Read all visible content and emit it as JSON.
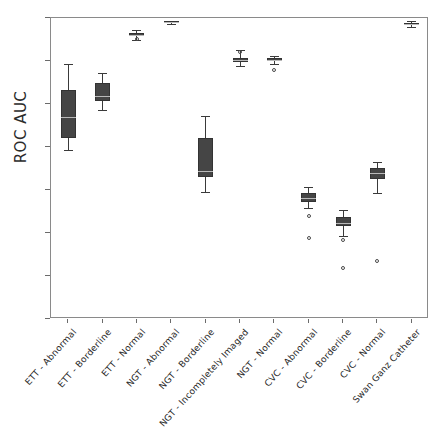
{
  "chart_data": {
    "type": "box",
    "title": "",
    "xlabel": "",
    "ylabel": "ROC AUC",
    "ylim": [
      65,
      100
    ],
    "yticks": [
      65,
      70,
      75,
      80,
      85,
      90,
      95,
      100
    ],
    "grid": false,
    "legend": "none",
    "accent_color": "#454545",
    "median_color": "#b9b9b9",
    "categories": [
      "ETT - Abnormal",
      "ETT - Borderline",
      "ETT - Normal",
      "NGT - Abnormal",
      "NGT - Borderline",
      "NGT - Incompletely Imaged",
      "NGT - Normal",
      "CVC - Abnormal",
      "CVC - Borderline",
      "CVC - Normal",
      "Swan Ganz Catheter"
    ],
    "boxes": [
      {
        "category": "ETT - Abnormal",
        "whisker_low": 84.7,
        "q1": 86.1,
        "median": 88.5,
        "q3": 91.6,
        "whisker_high": 94.7,
        "outliers": []
      },
      {
        "category": "ETT - Borderline",
        "whisker_low": 89.3,
        "q1": 90.3,
        "median": 90.9,
        "q3": 92.4,
        "whisker_high": 93.6,
        "outliers": []
      },
      {
        "category": "ETT - Normal",
        "whisker_low": 97.4,
        "q1": 97.9,
        "median": 98.0,
        "q3": 98.2,
        "whisker_high": 98.6,
        "outliers": [
          97.6
        ]
      },
      {
        "category": "NGT - Abnormal",
        "whisker_low": 99.3,
        "q1": 99.4,
        "median": 99.5,
        "q3": 99.6,
        "whisker_high": 99.7,
        "outliers": []
      },
      {
        "category": "NGT - Borderline",
        "whisker_low": 79.8,
        "q1": 81.5,
        "median": 82.2,
        "q3": 86.0,
        "whisker_high": 88.6,
        "outliers": []
      },
      {
        "category": "NGT - Incompletely Imaged",
        "whisker_low": 94.4,
        "q1": 94.9,
        "median": 95.1,
        "q3": 95.4,
        "whisker_high": 96.3,
        "outliers": [
          96.0
        ]
      },
      {
        "category": "NGT - Normal",
        "whisker_low": 94.7,
        "q1": 95.0,
        "median": 95.1,
        "q3": 95.3,
        "whisker_high": 95.6,
        "outliers": [
          93.9
        ]
      },
      {
        "category": "CVC - Abnormal",
        "whisker_low": 77.9,
        "q1": 78.6,
        "median": 79.1,
        "q3": 79.6,
        "whisker_high": 80.3,
        "outliers": [
          77.0,
          74.4
        ]
      },
      {
        "category": "CVC - Borderline",
        "whisker_low": 74.7,
        "q1": 75.8,
        "median": 76.2,
        "q3": 76.9,
        "whisker_high": 77.7,
        "outliers": [
          74.2,
          70.9
        ]
      },
      {
        "category": "CVC - Normal",
        "whisker_low": 79.6,
        "q1": 81.3,
        "median": 82.0,
        "q3": 82.6,
        "whisker_high": 83.3,
        "outliers": [
          71.7
        ]
      },
      {
        "category": "Swan Ganz Catheter",
        "whisker_low": 98.9,
        "q1": 99.2,
        "median": 99.3,
        "q3": 99.4,
        "whisker_high": 99.7,
        "outliers": []
      }
    ]
  }
}
